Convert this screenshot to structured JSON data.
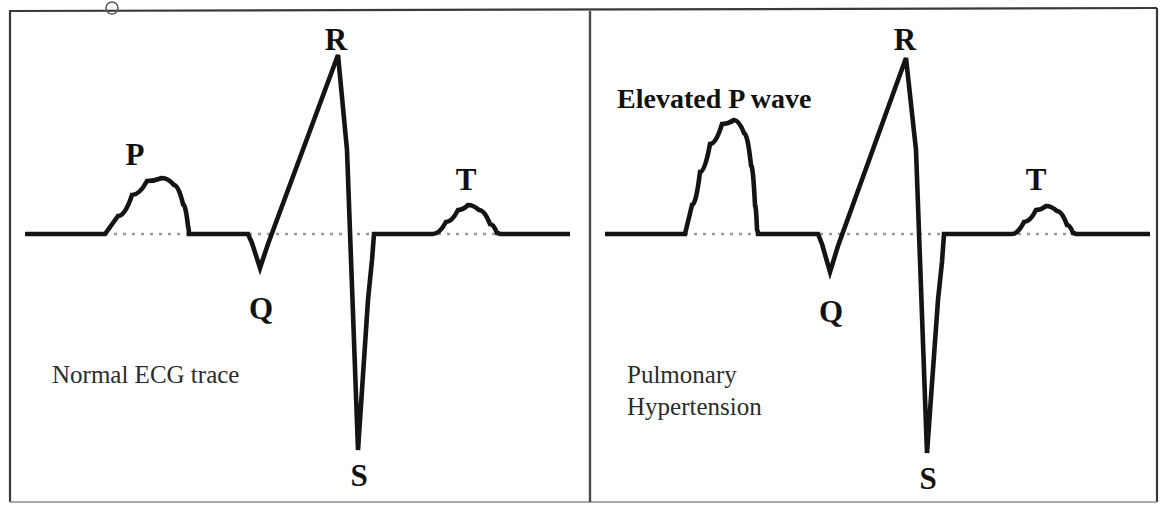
{
  "figure": {
    "width": 1165,
    "height": 505,
    "background_color": "#ffffff",
    "trace_color": "#141414",
    "baseline_color": "#9a9a9a",
    "frame_color": "#3a3a3a",
    "text_color": "#111111"
  },
  "chart_data": {
    "type": "line",
    "xlabel": "",
    "ylabel": "",
    "grid": false,
    "legend_position": "none",
    "baseline_y": 234,
    "panels": [
      {
        "name": "normal",
        "caption": "Normal ECG trace",
        "annotation": "",
        "isoelectric_baseline": 234,
        "waveform_points": [
          [
            25,
            234
          ],
          [
            105,
            234
          ],
          [
            118,
            216
          ],
          [
            132,
            195
          ],
          [
            147,
            181
          ],
          [
            162,
            178
          ],
          [
            174,
            185
          ],
          [
            183,
            204
          ],
          [
            188,
            226
          ],
          [
            189,
            234
          ],
          [
            248,
            234
          ],
          [
            252,
            243
          ],
          [
            260,
            268
          ],
          [
            268,
            244
          ],
          [
            338,
            55
          ],
          [
            347,
            150
          ],
          [
            358,
            450
          ],
          [
            368,
            300
          ],
          [
            372,
            260
          ],
          [
            374,
            234
          ],
          [
            433,
            234
          ],
          [
            446,
            222
          ],
          [
            458,
            210
          ],
          [
            468,
            205
          ],
          [
            479,
            210
          ],
          [
            490,
            224
          ],
          [
            497,
            233
          ],
          [
            500,
            234
          ],
          [
            570,
            234
          ]
        ],
        "dotted_baseline_span": [
          105,
          572
        ],
        "wave_labels": [
          {
            "text": "P",
            "x": 135,
            "y": 165
          },
          {
            "text": "R",
            "x": 336,
            "y": 50
          },
          {
            "text": "Q",
            "x": 261,
            "y": 319
          },
          {
            "text": "S",
            "x": 359,
            "y": 486
          },
          {
            "text": "T",
            "x": 466,
            "y": 190
          }
        ]
      },
      {
        "name": "pulmonary-hypertension",
        "caption_line_1": "Pulmonary",
        "caption_line_2": "Hypertension",
        "annotation": "Elevated P wave",
        "isoelectric_baseline": 234,
        "waveform_points": [
          [
            605,
            234
          ],
          [
            685,
            234
          ],
          [
            692,
            205
          ],
          [
            700,
            172
          ],
          [
            710,
            144
          ],
          [
            722,
            124
          ],
          [
            734,
            120
          ],
          [
            744,
            133
          ],
          [
            751,
            165
          ],
          [
            755,
            205
          ],
          [
            757,
            229
          ],
          [
            758,
            234
          ],
          [
            818,
            234
          ],
          [
            822,
            244
          ],
          [
            830,
            272
          ],
          [
            838,
            246
          ],
          [
            906,
            58
          ],
          [
            916,
            150
          ],
          [
            927,
            453
          ],
          [
            938,
            300
          ],
          [
            942,
            262
          ],
          [
            944,
            234
          ],
          [
            1012,
            234
          ],
          [
            1024,
            222
          ],
          [
            1036,
            210
          ],
          [
            1046,
            206
          ],
          [
            1057,
            211
          ],
          [
            1067,
            225
          ],
          [
            1073,
            233
          ],
          [
            1076,
            234
          ],
          [
            1150,
            234
          ]
        ],
        "dotted_baseline_span": [
          685,
          1152
        ],
        "wave_labels": [
          {
            "text": "R",
            "x": 905,
            "y": 50
          },
          {
            "text": "Q",
            "x": 831,
            "y": 322
          },
          {
            "text": "S",
            "x": 928,
            "y": 489
          },
          {
            "text": "T",
            "x": 1036,
            "y": 190
          }
        ]
      }
    ],
    "peak_amplitudes": {
      "normal_p_peak_y": 178,
      "normal_r_peak_y": 55,
      "normal_q_trough_y": 268,
      "normal_s_trough_y": 450,
      "normal_t_peak_y": 205,
      "pulmonary_p_peak_y": 120,
      "pulmonary_r_peak_y": 58,
      "pulmonary_q_trough_y": 272,
      "pulmonary_s_trough_y": 453,
      "pulmonary_t_peak_y": 206
    }
  },
  "layout": {
    "frame_left": 10,
    "frame_top": 11,
    "frame_right": 1157,
    "frame_bottom": 502,
    "divider_x": 590
  },
  "annotations": {
    "left_caption": "Normal ECG trace",
    "left_caption_x": 52,
    "left_caption_y": 383,
    "right_annotation": "Elevated P wave",
    "right_annotation_x": 617,
    "right_annotation_y": 108,
    "right_caption_line_1": "Pulmonary",
    "right_caption_line_2": "Hypertension",
    "right_caption_x": 627,
    "right_caption_y_1": 383,
    "right_caption_y_2": 415
  }
}
